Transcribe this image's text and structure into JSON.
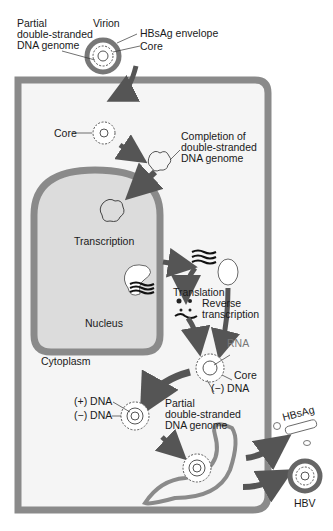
{
  "figure": {
    "colors": {
      "membrane": "#8a8a8a",
      "membrane_dark": "#5a5a5a",
      "cytoplasm": "#f5f5f5",
      "nucleus": "#dcdcdc",
      "arrow": "#555555",
      "text": "#1a1a1a"
    },
    "labels": {
      "virion_partial_genome": "Partial\ndouble-stranded\nDNA genome",
      "virion": "Virion",
      "hbsag_envelope": "HBsAg envelope",
      "virion_core": "Core",
      "core": "Core",
      "completion": "Completion of\ndouble-stranded\nDNA genome",
      "transcription": "Transcription",
      "translation": "Translation",
      "reverse_transcription": "Reverse\ntranscription",
      "nucleus": "Nucleus",
      "cytoplasm": "Cytoplasm",
      "rna": "RNA",
      "core_rna": "Core",
      "minus_dna_right": "(−) DNA",
      "plus_dna": "(+) DNA",
      "minus_dna_left": "(−) DNA",
      "partial_genome_lower": "Partial\ndouble-stranded\nDNA genome",
      "hbsag": "HBsAg",
      "hbv": "HBV"
    }
  }
}
